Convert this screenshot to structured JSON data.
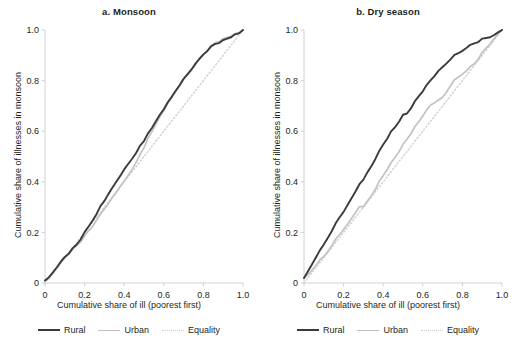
{
  "figure": {
    "width": 517,
    "height": 345,
    "background": "#ffffff"
  },
  "legend": {
    "position": "bottom-center",
    "entries": [
      {
        "label": "Rural",
        "color": "#3b3b3b",
        "style": "solid"
      },
      {
        "label": "Urban",
        "color": "#c2c2c2",
        "style": "solid"
      },
      {
        "label": "Equality",
        "color": "#cfcfcf",
        "style": "dotted"
      }
    ]
  },
  "axis": {
    "ticks": [
      "0",
      "0.2",
      "0.4",
      "0.6",
      "0.8",
      "1.0"
    ],
    "tick_values": [
      0,
      0.2,
      0.4,
      0.6,
      0.8,
      1.0
    ],
    "xlabel": "Cumulative share of ill (poorest first)",
    "ylabel": "Cumulative share of illnesses in monsoon",
    "xlim": [
      0,
      1
    ],
    "ylim": [
      0,
      1
    ]
  },
  "chart_data": [
    {
      "type": "line",
      "title": "a. Monsoon",
      "xlabel": "Cumulative share of ill (poorest first)",
      "ylabel": "Cumulative share of illnesses in monsoon",
      "xlim": [
        0,
        1
      ],
      "ylim": [
        0,
        1
      ],
      "xticks": [
        0,
        0.2,
        0.4,
        0.6,
        0.8,
        1.0
      ],
      "yticks": [
        0,
        0.2,
        0.4,
        0.6,
        0.8,
        1.0
      ],
      "xticklabels": [
        "0",
        "0.2",
        "0.4",
        "0.6",
        "0.8",
        "1.0"
      ],
      "yticklabels": [
        "0",
        "0.2",
        "0.4",
        "0.6",
        "0.8",
        "1.0"
      ],
      "grid": false,
      "legend": [
        "Rural",
        "Urban",
        "Equality"
      ],
      "x": [
        0.0,
        0.02,
        0.04,
        0.06,
        0.08,
        0.1,
        0.12,
        0.14,
        0.16,
        0.18,
        0.2,
        0.22,
        0.24,
        0.26,
        0.28,
        0.3,
        0.32,
        0.34,
        0.36,
        0.38,
        0.4,
        0.42,
        0.44,
        0.46,
        0.48,
        0.5,
        0.52,
        0.54,
        0.56,
        0.58,
        0.6,
        0.62,
        0.64,
        0.66,
        0.68,
        0.7,
        0.72,
        0.74,
        0.76,
        0.78,
        0.8,
        0.82,
        0.84,
        0.86,
        0.88,
        0.9,
        0.92,
        0.94,
        0.96,
        0.98,
        1.0
      ],
      "series": [
        {
          "name": "Rural",
          "color": "#3b3b3b",
          "width": 1.9,
          "style": "solid",
          "values": [
            0.01,
            0.025,
            0.045,
            0.062,
            0.082,
            0.102,
            0.12,
            0.142,
            0.152,
            0.175,
            0.2,
            0.222,
            0.248,
            0.272,
            0.3,
            0.322,
            0.35,
            0.372,
            0.398,
            0.422,
            0.448,
            0.47,
            0.492,
            0.515,
            0.54,
            0.562,
            0.588,
            0.612,
            0.64,
            0.662,
            0.688,
            0.712,
            0.735,
            0.76,
            0.782,
            0.805,
            0.828,
            0.848,
            0.868,
            0.888,
            0.905,
            0.92,
            0.932,
            0.942,
            0.95,
            0.958,
            0.966,
            0.974,
            0.982,
            0.991,
            1.0
          ]
        },
        {
          "name": "Urban",
          "color": "#c2c2c2",
          "width": 1.7,
          "style": "solid",
          "values": [
            0.008,
            0.022,
            0.042,
            0.058,
            0.078,
            0.098,
            0.118,
            0.138,
            0.148,
            0.165,
            0.185,
            0.205,
            0.225,
            0.248,
            0.268,
            0.29,
            0.312,
            0.334,
            0.356,
            0.38,
            0.402,
            0.425,
            0.45,
            0.478,
            0.505,
            0.535,
            0.568,
            0.598,
            0.628,
            0.655,
            0.682,
            0.708,
            0.732,
            0.757,
            0.78,
            0.804,
            0.826,
            0.846,
            0.866,
            0.886,
            0.904,
            0.92,
            0.934,
            0.946,
            0.956,
            0.964,
            0.971,
            0.978,
            0.985,
            0.992,
            1.0
          ]
        },
        {
          "name": "Equality",
          "color": "#cfcfcf",
          "width": 1.4,
          "style": "dotted",
          "values": [
            0.0,
            0.02,
            0.04,
            0.06,
            0.08,
            0.1,
            0.12,
            0.14,
            0.16,
            0.18,
            0.2,
            0.22,
            0.24,
            0.26,
            0.28,
            0.3,
            0.32,
            0.34,
            0.36,
            0.38,
            0.4,
            0.42,
            0.44,
            0.46,
            0.48,
            0.5,
            0.52,
            0.54,
            0.56,
            0.58,
            0.6,
            0.62,
            0.64,
            0.66,
            0.68,
            0.7,
            0.72,
            0.74,
            0.76,
            0.78,
            0.8,
            0.82,
            0.84,
            0.86,
            0.88,
            0.9,
            0.92,
            0.94,
            0.96,
            0.98,
            1.0
          ]
        }
      ]
    },
    {
      "type": "line",
      "title": "b. Dry season",
      "xlabel": "Cumulative share of ill (poorest first)",
      "ylabel": "Cumulative share of illnesses in monsoon",
      "xlim": [
        0,
        1
      ],
      "ylim": [
        0,
        1
      ],
      "xticks": [
        0,
        0.2,
        0.4,
        0.6,
        0.8,
        1.0
      ],
      "yticks": [
        0,
        0.2,
        0.4,
        0.6,
        0.8,
        1.0
      ],
      "xticklabels": [
        "0",
        "0.2",
        "0.4",
        "0.6",
        "0.8",
        "1.0"
      ],
      "yticklabels": [
        "0",
        "0.2",
        "0.4",
        "0.6",
        "0.8",
        "1.0"
      ],
      "grid": false,
      "legend": [
        "Rural",
        "Urban",
        "Equality"
      ],
      "x": [
        0.0,
        0.02,
        0.04,
        0.06,
        0.08,
        0.1,
        0.12,
        0.14,
        0.16,
        0.18,
        0.2,
        0.22,
        0.24,
        0.26,
        0.28,
        0.3,
        0.32,
        0.34,
        0.36,
        0.38,
        0.4,
        0.42,
        0.44,
        0.46,
        0.48,
        0.5,
        0.52,
        0.54,
        0.56,
        0.58,
        0.6,
        0.62,
        0.64,
        0.66,
        0.68,
        0.7,
        0.72,
        0.74,
        0.76,
        0.78,
        0.8,
        0.82,
        0.84,
        0.86,
        0.88,
        0.9,
        0.92,
        0.94,
        0.96,
        0.98,
        1.0
      ],
      "series": [
        {
          "name": "Rural",
          "color": "#3b3b3b",
          "width": 1.9,
          "style": "solid",
          "values": [
            0.02,
            0.048,
            0.075,
            0.1,
            0.128,
            0.155,
            0.182,
            0.205,
            0.232,
            0.258,
            0.282,
            0.308,
            0.335,
            0.362,
            0.388,
            0.412,
            0.438,
            0.465,
            0.492,
            0.518,
            0.545,
            0.57,
            0.595,
            0.618,
            0.64,
            0.662,
            0.672,
            0.692,
            0.715,
            0.738,
            0.76,
            0.78,
            0.798,
            0.818,
            0.838,
            0.855,
            0.868,
            0.882,
            0.898,
            0.912,
            0.922,
            0.93,
            0.938,
            0.948,
            0.956,
            0.962,
            0.968,
            0.975,
            0.982,
            0.991,
            1.0
          ]
        },
        {
          "name": "Urban",
          "color": "#c2c2c2",
          "width": 1.7,
          "style": "solid",
          "values": [
            0.018,
            0.035,
            0.052,
            0.07,
            0.09,
            0.108,
            0.128,
            0.148,
            0.17,
            0.19,
            0.212,
            0.232,
            0.255,
            0.278,
            0.3,
            0.305,
            0.325,
            0.348,
            0.372,
            0.398,
            0.422,
            0.448,
            0.472,
            0.498,
            0.522,
            0.545,
            0.57,
            0.592,
            0.615,
            0.638,
            0.662,
            0.682,
            0.7,
            0.712,
            0.722,
            0.735,
            0.755,
            0.778,
            0.8,
            0.818,
            0.83,
            0.84,
            0.852,
            0.868,
            0.888,
            0.908,
            0.928,
            0.948,
            0.968,
            0.985,
            1.0
          ]
        },
        {
          "name": "Equality",
          "color": "#cfcfcf",
          "width": 1.4,
          "style": "dotted",
          "values": [
            0.0,
            0.02,
            0.04,
            0.06,
            0.08,
            0.1,
            0.12,
            0.14,
            0.16,
            0.18,
            0.2,
            0.22,
            0.24,
            0.26,
            0.28,
            0.3,
            0.32,
            0.34,
            0.36,
            0.38,
            0.4,
            0.42,
            0.44,
            0.46,
            0.48,
            0.5,
            0.52,
            0.54,
            0.56,
            0.58,
            0.6,
            0.62,
            0.64,
            0.66,
            0.68,
            0.7,
            0.72,
            0.74,
            0.76,
            0.78,
            0.8,
            0.82,
            0.84,
            0.86,
            0.88,
            0.9,
            0.92,
            0.94,
            0.96,
            0.98,
            1.0
          ]
        }
      ]
    }
  ]
}
